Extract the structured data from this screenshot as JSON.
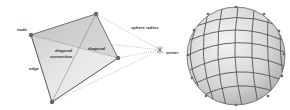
{
  "left_diagram": {
    "labels": {
      "node": "node",
      "edge": "edge",
      "diagonal_connection_line1": "diagonal",
      "diagonal_connection_line2": "connection",
      "diagonal": "diagonal",
      "sphere_radius": "sphere radius",
      "center": "center"
    }
  },
  "right_diagram": {
    "description": "spherical mesh of quadrilateral faces with nodes"
  },
  "colors": {
    "face_light": "#e8e8e8",
    "face_dark": "#b9b9b9",
    "edge": "#555555",
    "node": "#6a6a6a",
    "dotted": "#888888"
  }
}
